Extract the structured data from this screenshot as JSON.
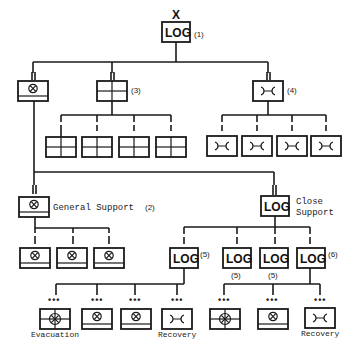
{
  "diagram": {
    "type": "military-logistics-org-chart",
    "top_marker": "X",
    "root": {
      "label": "LOG",
      "ref": "(1)"
    },
    "level2": {
      "maintenance": {
        "symbol": "maintenance-unit"
      },
      "supply": {
        "symbol": "supply-unit",
        "ref": "(3)",
        "children_count": 4
      },
      "transport": {
        "symbol": "transport-unit",
        "ref": "(4)",
        "children_count": 4
      }
    },
    "general_support": {
      "label": "General Support",
      "ref": "(2)",
      "children_count": 3
    },
    "close_support": {
      "label_line1": "Close",
      "label_line2": "Support",
      "box_label": "LOG",
      "children": [
        {
          "label": "LOG",
          "ref": "(5)",
          "ref_position": "right"
        },
        {
          "label": "LOG",
          "ref": "(5)",
          "ref_position": "below"
        },
        {
          "label": "LOG",
          "ref": "(5)",
          "ref_position": "below"
        },
        {
          "label": "LOG",
          "ref": "(6)",
          "ref_position": "right"
        }
      ]
    },
    "bottom_left_group": {
      "dots": "•••",
      "units": [
        {
          "symbol": "medical-evacuation",
          "label": "Evacuation"
        },
        {
          "symbol": "maintenance-unit",
          "label": ""
        },
        {
          "symbol": "maintenance-unit",
          "label": ""
        },
        {
          "symbol": "transport-unit",
          "label": "Recovery"
        }
      ]
    },
    "bottom_right_group": {
      "dots": "•••",
      "units": [
        {
          "symbol": "medical-evacuation",
          "label": ""
        },
        {
          "symbol": "maintenance-unit",
          "label": ""
        },
        {
          "symbol": "transport-unit",
          "label": "Recovery"
        }
      ]
    }
  }
}
